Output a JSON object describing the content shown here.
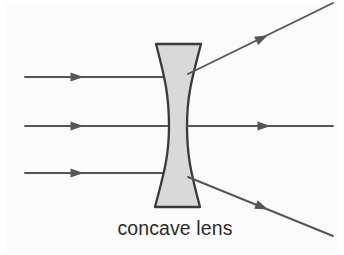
{
  "figure": {
    "caption": "concave lens",
    "background_color": "#fbfbfb",
    "page_color": "#ffffff",
    "width": 344,
    "height": 255
  },
  "lens": {
    "name": "concave lens",
    "shape": "biconcave",
    "fill_color": "#d9d9d9",
    "outline_color": "#3a3a3a",
    "top_y": 44,
    "bottom_y": 207,
    "top_left_x": 156,
    "top_right_x": 201,
    "bottom_left_x": 155,
    "bottom_right_x": 200,
    "waist_left_x": 169,
    "waist_right_x": 187,
    "center_y": 126
  },
  "rays": {
    "color": "#555555",
    "arrow_color": "#555555",
    "incoming": [
      {
        "label": "upper incident ray",
        "x1": 25,
        "y1": 77,
        "x2": 172,
        "y2": 77,
        "arrow_x": 77,
        "arrow_y": 77
      },
      {
        "label": "axial incident ray",
        "x1": 25,
        "y1": 126,
        "x2": 170,
        "y2": 126,
        "arrow_x": 77,
        "arrow_y": 126
      },
      {
        "label": "lower incident ray",
        "x1": 25,
        "y1": 173,
        "x2": 172,
        "y2": 173,
        "arrow_x": 77,
        "arrow_y": 173
      }
    ],
    "outgoing": [
      {
        "label": "upper diverged ray",
        "x1": 188,
        "y1": 74,
        "x2": 333,
        "y2": 3,
        "arrow_x": 262,
        "arrow_y": 38
      },
      {
        "label": "axial transmitted ray",
        "x1": 187,
        "y1": 126,
        "x2": 333,
        "y2": 126,
        "arrow_x": 264,
        "arrow_y": 126
      },
      {
        "label": "lower diverged ray",
        "x1": 188,
        "y1": 177,
        "x2": 333,
        "y2": 236,
        "arrow_x": 262,
        "arrow_y": 207
      }
    ]
  },
  "caption": {
    "text": "concave lens",
    "x": 175,
    "y": 235,
    "font_size": 19.5,
    "color": "#2b2b2b"
  }
}
